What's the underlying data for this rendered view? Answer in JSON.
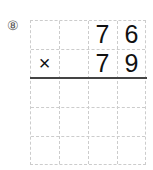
{
  "problem": {
    "number_label": "⑧",
    "operator": "×",
    "multiplicand": [
      "7",
      "6"
    ],
    "multiplier": [
      "7",
      "9"
    ]
  }
}
